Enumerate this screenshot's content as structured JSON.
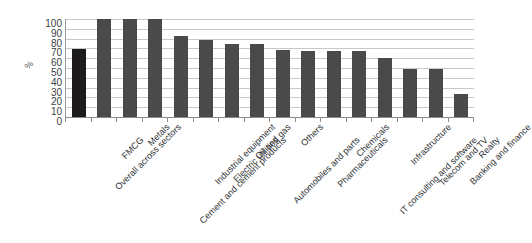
{
  "chart_data": {
    "type": "bar",
    "title": "",
    "subtitle": "",
    "xlabel": "",
    "ylabel": "%",
    "ylim": [
      0,
      100
    ],
    "ytick_step": 10,
    "yticks": [
      100,
      90,
      80,
      70,
      60,
      50,
      40,
      30,
      20,
      10,
      0
    ],
    "grid": true,
    "legend": "none",
    "highlight_index": 0,
    "colors": {
      "bar": "#4a4a4a",
      "bar_highlight": "#1c1a1b",
      "gridline": "#c8c8c8",
      "axis": "#8f8f8f",
      "text": "#2f3335",
      "background": "#ffffff"
    },
    "categories": [
      "Overall across sectors",
      "FMCG",
      "Metals",
      "Cement and cement products",
      "Industrial equipment",
      "Electric utilities",
      "Oil and gas",
      "Automobiles and parts",
      "Others",
      "Pharmaceuticals",
      "Chemicals",
      "IT consulting and software",
      "Infrastructure",
      "Telecom and TV",
      "Banking and finance",
      "Realty"
    ],
    "values": [
      69,
      100,
      100,
      100,
      83,
      79,
      75,
      75,
      68,
      67,
      67,
      67,
      60,
      49,
      49,
      23
    ]
  }
}
